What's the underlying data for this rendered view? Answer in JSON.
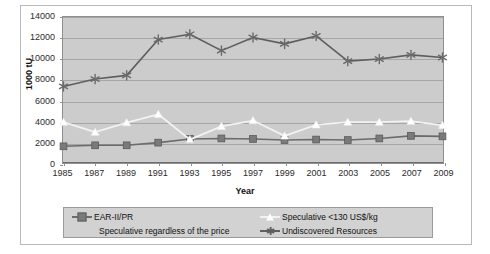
{
  "chart_data": {
    "type": "line",
    "title": "",
    "xlabel": "Year",
    "ylabel": "1000 tU",
    "xlim": [
      1985,
      2009
    ],
    "ylim": [
      0,
      14000
    ],
    "ytick_step": 2000,
    "grid": true,
    "legend_position": "bottom",
    "categories": [
      1985,
      1987,
      1989,
      1991,
      1993,
      1995,
      1997,
      1999,
      2001,
      2003,
      2005,
      2007,
      2009
    ],
    "xtick_labels": [
      "1985",
      "1987",
      "1989",
      "1991",
      "1993",
      "1995",
      "1997",
      "1999",
      "2001",
      "2003",
      "2005",
      "2007",
      "2009"
    ],
    "ytick_labels": [
      "0",
      "2000",
      "4000",
      "6000",
      "8000",
      "10000",
      "12000",
      "14000"
    ],
    "series": [
      {
        "name": "EAR-II/PR",
        "marker": "square",
        "color": "#7a7a7a",
        "line_color": "#6b6b6b",
        "values": [
          1700,
          1800,
          1800,
          2050,
          2400,
          2450,
          2400,
          2300,
          2350,
          2300,
          2450,
          2700,
          2650
        ]
      },
      {
        "name": "Speculative <130 US$/kg",
        "marker": "triangle",
        "color": "#ffffff",
        "line_color": "#f2f2f2",
        "values": [
          4000,
          3050,
          3950,
          4750,
          2350,
          3600,
          4150,
          2700,
          3750,
          4000,
          4000,
          4100,
          3700
        ]
      },
      {
        "name": "Speculative regardless of the price",
        "marker": "none",
        "color": "#bdbdbd",
        "line_color": "#bdbdbd",
        "values": [
          null,
          null,
          null,
          null,
          null,
          null,
          null,
          null,
          null,
          null,
          null,
          null,
          null
        ]
      },
      {
        "name": "Undiscovered Resources",
        "marker": "asterisk",
        "color": "#6b6b6b",
        "line_color": "#5e5e5e",
        "values": [
          7400,
          8100,
          8450,
          11850,
          12350,
          10800,
          12050,
          11450,
          12200,
          9800,
          10000,
          10400,
          10150
        ]
      }
    ]
  },
  "legend": {
    "entries": [
      {
        "label": "EAR-II/PR"
      },
      {
        "label": "Speculative <130 US$/kg"
      },
      {
        "label": "Speculative regardless of the price"
      },
      {
        "label": "Undiscovered Resources"
      }
    ]
  }
}
